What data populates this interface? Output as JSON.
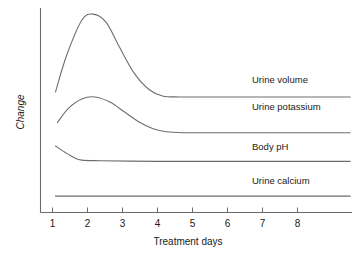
{
  "chart_data": {
    "type": "line",
    "title": "",
    "xlabel": "Treatment days",
    "ylabel": "Change",
    "xlim": [
      0.6,
      8.9
    ],
    "ylim": [
      0,
      100
    ],
    "grid": false,
    "legend_position": "inline-right",
    "xticks": [
      "1",
      "2",
      "3",
      "4",
      "5",
      "6",
      "7",
      "8"
    ],
    "xtick_values": [
      1,
      2,
      3,
      4,
      5,
      6,
      7,
      8
    ],
    "yticks": [],
    "series": [
      {
        "name": "Urine volume",
        "label": "Urine volume",
        "x": [
          1.0,
          1.3,
          1.7,
          2.0,
          2.35,
          2.7,
          3.1,
          3.5,
          3.85,
          4.3,
          5.0,
          6.0,
          7.0,
          8.0,
          8.85
        ],
        "values": [
          59,
          77,
          94,
          97,
          93,
          81,
          68,
          60,
          57,
          56.5,
          56.5,
          56.5,
          56.5,
          56.5,
          56.5
        ]
      },
      {
        "name": "Urine potassium",
        "label": "Urine potassium",
        "x": [
          1.05,
          1.35,
          1.7,
          2.05,
          2.45,
          2.85,
          3.25,
          3.6,
          3.95,
          4.4,
          5.0,
          6.0,
          7.0,
          8.0,
          8.85
        ],
        "values": [
          44,
          51,
          55.5,
          56.5,
          54,
          49,
          44,
          41,
          39.5,
          39,
          39,
          39,
          39,
          39,
          39
        ]
      },
      {
        "name": "Body pH",
        "label": "Body pH",
        "x": [
          1.0,
          1.25,
          1.5,
          1.7,
          2.2,
          3.0,
          4.0,
          5.0,
          6.0,
          7.0,
          8.0,
          8.85
        ],
        "values": [
          32.5,
          29.5,
          26.8,
          25.6,
          25.3,
          25.1,
          25.0,
          25.0,
          25.0,
          25.0,
          25.0,
          25.0
        ]
      },
      {
        "name": "Urine calcium",
        "label": "Urine calcium",
        "x": [
          1.0,
          2.0,
          3.0,
          4.0,
          5.0,
          6.0,
          7.0,
          8.0,
          8.85
        ],
        "values": [
          8.0,
          8.0,
          8.0,
          8.0,
          8.0,
          8.0,
          8.0,
          8.0,
          8.0
        ]
      }
    ],
    "annotations": [
      {
        "text": "Urine volume",
        "x_px": 252,
        "y_px": 83
      },
      {
        "text": "Urine potassium",
        "x_px": 252,
        "y_px": 110
      },
      {
        "text": "Body pH",
        "x_px": 252,
        "y_px": 150
      },
      {
        "text": "Urine calcium",
        "x_px": 252,
        "y_px": 184
      }
    ],
    "colors": {
      "line": "#6e6e6e",
      "axis": "#6b6b6b",
      "text": "#1a1a1a",
      "background": "#ffffff"
    }
  }
}
